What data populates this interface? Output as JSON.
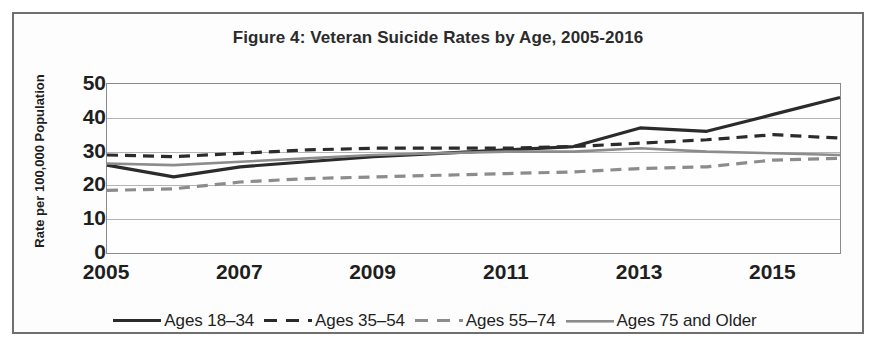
{
  "figure": {
    "title": "Figure 4: Veteran Suicide Rates by Age, 2005-2016"
  },
  "chart_data": {
    "type": "line",
    "title": "Figure 4: Veteran Suicide Rates by Age, 2005-2016",
    "xlabel": "",
    "ylabel": "Rate per 100,000 Population",
    "xlim": [
      2005,
      2016
    ],
    "ylim": [
      0,
      50
    ],
    "ytick_labels": [
      "50",
      "40",
      "30",
      "20",
      "10",
      "0"
    ],
    "ytick_values": [
      50,
      40,
      30,
      20,
      10,
      0
    ],
    "xtick_labels": [
      "2005",
      "2007",
      "2009",
      "2011",
      "2013",
      "2015"
    ],
    "xtick_values": [
      2005,
      2007,
      2009,
      2011,
      2013,
      2015
    ],
    "x": [
      2005,
      2006,
      2007,
      2008,
      2009,
      2010,
      2011,
      2012,
      2013,
      2014,
      2015,
      2016
    ],
    "grid": true,
    "legend_position": "bottom",
    "series": [
      {
        "name": "Ages 18–34",
        "style": "solid",
        "color": "#2b2b2b",
        "width": 3.2,
        "values": [
          26.0,
          22.5,
          25.5,
          27.0,
          28.5,
          29.5,
          30.5,
          31.5,
          37.0,
          36.0,
          41.0,
          46.0
        ]
      },
      {
        "name": "Ages 35–54",
        "style": "dashed",
        "color": "#2b2b2b",
        "width": 3.2,
        "values": [
          29.0,
          28.5,
          29.5,
          30.5,
          31.0,
          31.0,
          31.0,
          31.5,
          32.5,
          33.5,
          35.0,
          34.0
        ]
      },
      {
        "name": "Ages 55–74",
        "style": "dashed",
        "color": "#8c8c8c",
        "width": 3.2,
        "values": [
          18.5,
          19.0,
          21.0,
          22.0,
          22.5,
          23.0,
          23.5,
          24.0,
          25.0,
          25.5,
          27.5,
          28.0
        ]
      },
      {
        "name": "Ages 75 and Older",
        "style": "solid",
        "color": "#8c8c8c",
        "width": 2.6,
        "values": [
          26.5,
          26.0,
          27.0,
          28.0,
          29.0,
          29.5,
          30.0,
          30.0,
          31.0,
          30.0,
          29.5,
          29.0
        ]
      }
    ]
  }
}
